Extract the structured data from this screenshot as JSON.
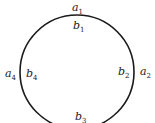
{
  "diagram": {
    "type": "circle-with-labels",
    "circle": {
      "cx": 77,
      "cy": 72,
      "r": 57,
      "stroke": "#1a1a1a"
    },
    "labels": [
      {
        "id": "a1",
        "letter": "a",
        "sub": "1",
        "x": 72,
        "y": 11
      },
      {
        "id": "b1",
        "letter": "b",
        "sub": "1",
        "x": 73,
        "y": 29
      },
      {
        "id": "a2",
        "letter": "a",
        "sub": "2",
        "x": 140,
        "y": 75
      },
      {
        "id": "b2",
        "letter": "b",
        "sub": "2",
        "x": 118,
        "y": 75
      },
      {
        "id": "a4",
        "letter": "a",
        "sub": "4",
        "x": 5,
        "y": 77
      },
      {
        "id": "b4",
        "letter": "b",
        "sub": "4",
        "x": 26,
        "y": 77
      },
      {
        "id": "b3",
        "letter": "b",
        "sub": "3",
        "x": 75,
        "y": 120
      }
    ]
  }
}
